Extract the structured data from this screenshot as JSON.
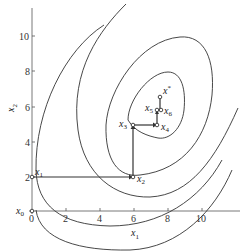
{
  "diagram": {
    "type": "coordinate-descent-contour-plot",
    "axes": {
      "x_label": "x",
      "x_label_sub": "1",
      "y_label": "x",
      "y_label_sub": "2",
      "x_ticks": [
        "0",
        "2",
        "4",
        "6",
        "8",
        "10"
      ],
      "y_ticks": [
        "2",
        "4",
        "6",
        "8",
        "10"
      ]
    },
    "points": [
      {
        "name": "x",
        "sub": "0",
        "coords": [
          0,
          0
        ]
      },
      {
        "name": "x",
        "sub": "1",
        "coords": [
          0,
          2
        ]
      },
      {
        "name": "x",
        "sub": "2",
        "coords": [
          6,
          2
        ]
      },
      {
        "name": "x",
        "sub": "3",
        "coords": [
          6,
          5
        ]
      },
      {
        "name": "x",
        "sub": "4",
        "coords": [
          7.4,
          5
        ]
      },
      {
        "name": "x",
        "sub": "5",
        "coords": [
          7.4,
          5.9
        ]
      },
      {
        "name": "x",
        "sub": "6",
        "coords": [
          7.6,
          5.9
        ]
      },
      {
        "name": "x",
        "sup": "*",
        "coords": [
          7.6,
          6.7
        ]
      }
    ],
    "contours": 4,
    "colors": {
      "line": "#333333",
      "path": "#333333"
    }
  }
}
